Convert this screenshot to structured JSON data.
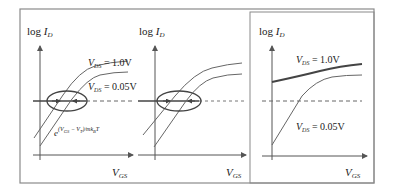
{
  "figure": {
    "panels": [
      {
        "id": "panel-1",
        "y_label": {
          "prefix": "log ",
          "var": "I",
          "sub": "D"
        },
        "x_label": {
          "var": "V",
          "sub": "GS"
        },
        "curve_labels": [
          {
            "var": "V",
            "sub": "DS",
            "value": " = 1.0V"
          },
          {
            "var": "V",
            "sub": "DS",
            "value": " = 0.05V"
          }
        ],
        "formula": {
          "base": "e",
          "exponent": "(V",
          "exp_sub1": "GS",
          "exp_mid": " − V",
          "exp_sub2": "T",
          "exp_end": ")/mk",
          "exp_sub3": "B",
          "exp_tail": "T"
        }
      },
      {
        "id": "panel-2",
        "y_label": {
          "prefix": "log ",
          "var": "I",
          "sub": "D"
        },
        "x_label": {
          "var": "V",
          "sub": "GS"
        }
      },
      {
        "id": "panel-3",
        "y_label": {
          "prefix": "log ",
          "var": "I",
          "sub": "D"
        },
        "x_label": {
          "var": "V",
          "sub": "GS"
        },
        "curve_labels": [
          {
            "var": "V",
            "sub": "DS",
            "value": " = 1.0V"
          },
          {
            "var": "V",
            "sub": "DS",
            "value": " = 0.05V"
          }
        ]
      }
    ],
    "colors": {
      "frame": "#8a8a8a",
      "axis": "#555555",
      "curve": "#666666",
      "curve_bold": "#444444",
      "text": "#222222"
    }
  }
}
